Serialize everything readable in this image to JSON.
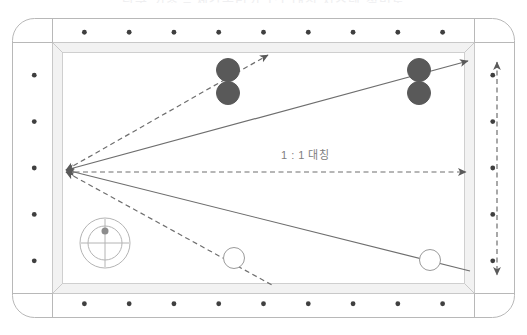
{
  "page": {
    "cut_off_title": "당구 기초 – 제각돌리기 1:1 대칭 시스템 설명도",
    "background_color": "#ffffff"
  },
  "table": {
    "name": "billiard-table",
    "cloth_color": "#ffffff",
    "rail_color": "#f7f7f7",
    "outline_color": "#b0b0b0",
    "cushion_color": "#fafafa",
    "outer": {
      "x": 12,
      "y": 18,
      "w": 503,
      "h": 300,
      "radius": 22
    },
    "rail_inner": {
      "x": 52,
      "y": 42,
      "w": 423,
      "h": 252
    },
    "playfield": {
      "x": 62,
      "y": 52,
      "w": 403,
      "h": 232
    },
    "diamond_color": "#3f3f3f",
    "diamond_radius": 2.4,
    "diamonds": {
      "top_count": 9,
      "bottom_count": 9,
      "left_count": 5,
      "right_count": 5
    }
  },
  "balls": [
    {
      "id": "ball-red-1",
      "label": "red-ball-upper-left",
      "cx": 228,
      "cy": 70,
      "r": 11.5,
      "fill": "#595959",
      "stroke": "#595959",
      "type": "object"
    },
    {
      "id": "ball-red-2",
      "label": "red-ball-lower-left",
      "cx": 228,
      "cy": 93,
      "r": 11.5,
      "fill": "#595959",
      "stroke": "#595959",
      "type": "object"
    },
    {
      "id": "ball-red-3",
      "label": "red-ball-upper-right",
      "cx": 419,
      "cy": 70,
      "r": 11.5,
      "fill": "#595959",
      "stroke": "#595959",
      "type": "object"
    },
    {
      "id": "ball-red-4",
      "label": "red-ball-lower-right",
      "cx": 419,
      "cy": 93,
      "r": 11.5,
      "fill": "#595959",
      "stroke": "#595959",
      "type": "object"
    },
    {
      "id": "ball-white-1",
      "label": "white-cue-ball-left",
      "cx": 234,
      "cy": 258,
      "r": 10.5,
      "fill": "#ffffff",
      "stroke": "#9a9a9a",
      "type": "cue"
    },
    {
      "id": "ball-white-2",
      "label": "white-cue-ball-right",
      "cx": 430,
      "cy": 260,
      "r": 10.5,
      "fill": "#ffffff",
      "stroke": "#9a9a9a",
      "type": "cue"
    }
  ],
  "target_marker": {
    "name": "aim-point-target-marker",
    "cx": 105,
    "cy": 243,
    "outer_r": 25,
    "inner_r": 17,
    "cross_len": 24,
    "dot_r": 3.5,
    "stroke": "#b4b4b4",
    "dot_fill": "#8c8c8c"
  },
  "vertex": {
    "x": 66,
    "y": 170
  },
  "lines": {
    "solid_color": "#6e6e6e",
    "dashed_color": "#6e6e6e",
    "solid": [
      {
        "name": "solid-line-to-upper-right-corner",
        "x1": 66,
        "y1": 170,
        "x2": 468,
        "y2": 61,
        "arrow": "both"
      },
      {
        "name": "solid-line-to-lower-right-pocket",
        "x1": 66,
        "y1": 170,
        "x2": 470,
        "y2": 271,
        "arrow": "start"
      }
    ],
    "dashed": [
      {
        "name": "dashed-line-through-red-balls",
        "x1": 66,
        "y1": 170,
        "x2": 268,
        "y2": 55,
        "arrow": "both"
      },
      {
        "name": "dashed-center-horizontal-line",
        "x1": 66,
        "y1": 172,
        "x2": 466,
        "y2": 172,
        "arrow": "both"
      },
      {
        "name": "dashed-line-through-white-ball",
        "x1": 66,
        "y1": 172,
        "x2": 272,
        "y2": 285,
        "arrow": "start"
      },
      {
        "name": "dashed-vertical-measure-right",
        "x1": 497,
        "y1": 62,
        "x2": 497,
        "y2": 275,
        "arrow": "both"
      }
    ]
  },
  "labels": {
    "ratio": "1 : 1 대칭"
  }
}
